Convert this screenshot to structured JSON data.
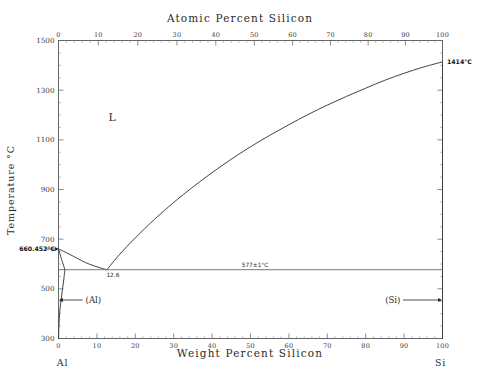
{
  "chart_data": {
    "type": "line",
    "title": "",
    "system": "Al-Si",
    "top_axis": {
      "label": "Atomic Percent Silicon",
      "ticks": [
        0,
        10,
        20,
        30,
        40,
        50,
        60,
        70,
        80,
        90,
        100
      ],
      "tick_labels": [
        "0",
        "10",
        "20",
        "30",
        "40",
        "50",
        "60",
        "70",
        "80",
        "90",
        "100"
      ]
    },
    "bottom_axis": {
      "label": "Weight Percent Silicon",
      "ticks": [
        0,
        10,
        20,
        30,
        40,
        50,
        60,
        70,
        80,
        90,
        100
      ],
      "tick_labels": [
        "0",
        "10",
        "20",
        "30",
        "40",
        "50",
        "60",
        "70",
        "80",
        "90",
        "100"
      ],
      "xlim": [
        0,
        100
      ]
    },
    "left_axis": {
      "label": "Temperature °C",
      "ticks": [
        300,
        500,
        700,
        900,
        1100,
        1300,
        1500
      ],
      "tick_labels": [
        "300",
        "500",
        "700",
        "900",
        "1100",
        "1300",
        "1500"
      ],
      "ylim": [
        300,
        1500
      ]
    },
    "endmembers": {
      "left": "Al",
      "right": "Si"
    },
    "phase_labels": [
      {
        "text": "L",
        "x": 14,
        "y": 1175
      },
      {
        "text": "(Al)",
        "x": 5.5,
        "y": 455
      },
      {
        "text": "(Si)",
        "x": 88,
        "y": 455
      }
    ],
    "annotations": [
      {
        "text": "660.452°C",
        "x": 0,
        "y": 660.452
      },
      {
        "text": "1414°C",
        "x": 100,
        "y": 1414
      },
      {
        "text": "577±1°C",
        "x": 50,
        "y": 577
      },
      {
        "text": "12.6",
        "x": 12.6,
        "y": 577
      }
    ],
    "invariant_line": {
      "temperature": 577,
      "label": "577±1°C",
      "x_start": 0,
      "x_end": 100
    },
    "series": [
      {
        "name": "Si liquidus",
        "points": [
          [
            12.6,
            577
          ],
          [
            16,
            640
          ],
          [
            20,
            705
          ],
          [
            25,
            780
          ],
          [
            30,
            848
          ],
          [
            35,
            910
          ],
          [
            40,
            968
          ],
          [
            45,
            1022
          ],
          [
            50,
            1072
          ],
          [
            55,
            1118
          ],
          [
            60,
            1161
          ],
          [
            65,
            1202
          ],
          [
            70,
            1240
          ],
          [
            75,
            1275
          ],
          [
            80,
            1308
          ],
          [
            85,
            1340
          ],
          [
            90,
            1368
          ],
          [
            95,
            1393
          ],
          [
            100,
            1414
          ]
        ]
      },
      {
        "name": "Al liquidus",
        "points": [
          [
            0,
            660.452
          ],
          [
            1.5,
            650
          ],
          [
            3,
            638
          ],
          [
            5,
            622
          ],
          [
            7,
            606
          ],
          [
            9,
            594
          ],
          [
            11,
            584
          ],
          [
            12.6,
            577
          ]
        ]
      },
      {
        "name": "Al solidus",
        "points": [
          [
            0,
            660.452
          ],
          [
            0.4,
            640
          ],
          [
            0.8,
            618
          ],
          [
            1.2,
            600
          ],
          [
            1.5,
            586
          ],
          [
            1.65,
            577
          ]
        ]
      },
      {
        "name": "Al solvus",
        "points": [
          [
            1.65,
            577
          ],
          [
            1.4,
            540
          ],
          [
            1.05,
            500
          ],
          [
            0.7,
            460
          ],
          [
            0.4,
            420
          ],
          [
            0.2,
            380
          ],
          [
            0.08,
            340
          ],
          [
            0.04,
            300
          ]
        ]
      },
      {
        "name": "Si solvus",
        "points": [
          [
            100,
            1414
          ],
          [
            100,
            577
          ],
          [
            100,
            300
          ]
        ]
      }
    ],
    "grid": false,
    "legend": null
  },
  "meta": {
    "temperature_unit": "°C",
    "eutectic_composition_wt": 12.6,
    "eutectic_temperature": 577,
    "al_melting_point": 660.452,
    "si_melting_point": 1414
  }
}
